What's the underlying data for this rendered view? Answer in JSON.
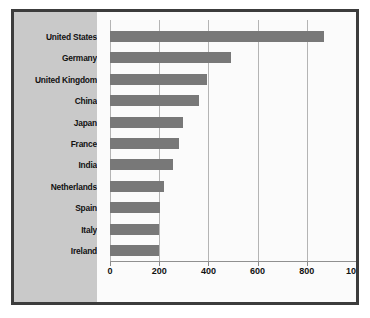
{
  "chart_data": {
    "type": "bar",
    "orientation": "horizontal",
    "title": "",
    "subtitle": "",
    "xlabel": "",
    "ylabel": "",
    "categories": [
      "United States",
      "Germany",
      "United Kingdom",
      "China",
      "Japan",
      "France",
      "India",
      "Netherlands",
      "Spain",
      "Italy",
      "Ireland"
    ],
    "values": [
      870,
      490,
      395,
      360,
      295,
      280,
      255,
      218,
      205,
      200,
      200
    ],
    "xlim": [
      0,
      1000
    ],
    "xticks": [
      0,
      200,
      400,
      600,
      800,
      1000
    ],
    "xtick_labels": [
      "0",
      "200",
      "400",
      "600",
      "800",
      "1000"
    ],
    "grid": true,
    "legend": false,
    "legend_position": "none",
    "bar_color": "#787878",
    "plot_background": "#fbfbfb",
    "panel_background": "#c9c9c9",
    "frame_color": "#3c3c3c",
    "gridline_color": "#b4b4b4",
    "axis_color": "#909090"
  }
}
